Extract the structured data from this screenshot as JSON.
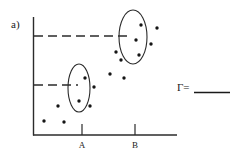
{
  "figure": {
    "panel_label": "a)",
    "answer_prefix": "Γ=",
    "answer_value": "",
    "axes": {
      "x_ticks": [
        {
          "label": "A",
          "x": 82
        },
        {
          "label": "B",
          "x": 135
        }
      ],
      "x_axis": {
        "x1": 33,
        "x2": 177,
        "y": 135
      },
      "y_axis": {
        "x": 33,
        "y1": 17,
        "y2": 135
      }
    },
    "threshold_lines": [
      {
        "name": "upper-threshold",
        "y": 36,
        "x1": 34,
        "x2": 128,
        "dashed": true
      },
      {
        "name": "lower-threshold",
        "y": 85,
        "x1": 34,
        "x2": 78,
        "dashed": true
      }
    ],
    "clusters": [
      {
        "name": "cluster-upper",
        "cx": 133,
        "cy": 37,
        "rx": 14,
        "ry": 27
      },
      {
        "name": "cluster-lower",
        "cx": 79,
        "cy": 88,
        "rx": 11,
        "ry": 24
      }
    ]
  },
  "chart_data": {
    "type": "scatter",
    "title": "",
    "xlabel": "",
    "ylabel": "",
    "xlim": [
      33,
      177
    ],
    "ylim": [
      135,
      10
    ],
    "grid": false,
    "legend": null,
    "annotations": [
      {
        "text": "a)",
        "x": 12,
        "y": 26
      },
      {
        "text": "Γ=",
        "x": 178,
        "y": 90
      }
    ],
    "xticks": [
      {
        "value": 82,
        "label": "A"
      },
      {
        "value": 135,
        "label": "B"
      }
    ],
    "reference_lines": [
      {
        "orientation": "horizontal",
        "y": 36,
        "style": "dashed"
      },
      {
        "orientation": "horizontal",
        "y": 85,
        "style": "dashed"
      }
    ],
    "ellipses": [
      {
        "label": "A-cluster",
        "cx": 79,
        "cy": 88,
        "rx": 11,
        "ry": 24
      },
      {
        "label": "B-cluster",
        "cx": 133,
        "cy": 37,
        "rx": 14,
        "ry": 27
      }
    ],
    "points": [
      {
        "x": 141,
        "y": 25,
        "group": "B-cluster"
      },
      {
        "x": 136,
        "y": 40,
        "group": "B-cluster"
      },
      {
        "x": 139,
        "y": 55,
        "group": "B-cluster"
      },
      {
        "x": 157,
        "y": 28,
        "group": "scatter"
      },
      {
        "x": 151,
        "y": 44,
        "group": "scatter"
      },
      {
        "x": 116,
        "y": 52,
        "group": "scatter"
      },
      {
        "x": 121,
        "y": 60,
        "group": "scatter"
      },
      {
        "x": 110,
        "y": 74,
        "group": "scatter"
      },
      {
        "x": 124,
        "y": 78,
        "group": "scatter"
      },
      {
        "x": 85,
        "y": 78,
        "group": "A-cluster"
      },
      {
        "x": 94,
        "y": 87,
        "group": "A-cluster"
      },
      {
        "x": 79,
        "y": 101,
        "group": "A-cluster"
      },
      {
        "x": 90,
        "y": 106,
        "group": "A-cluster"
      },
      {
        "x": 58,
        "y": 106,
        "group": "scatter"
      },
      {
        "x": 44,
        "y": 121,
        "group": "scatter"
      },
      {
        "x": 64,
        "y": 122,
        "group": "scatter"
      }
    ]
  }
}
